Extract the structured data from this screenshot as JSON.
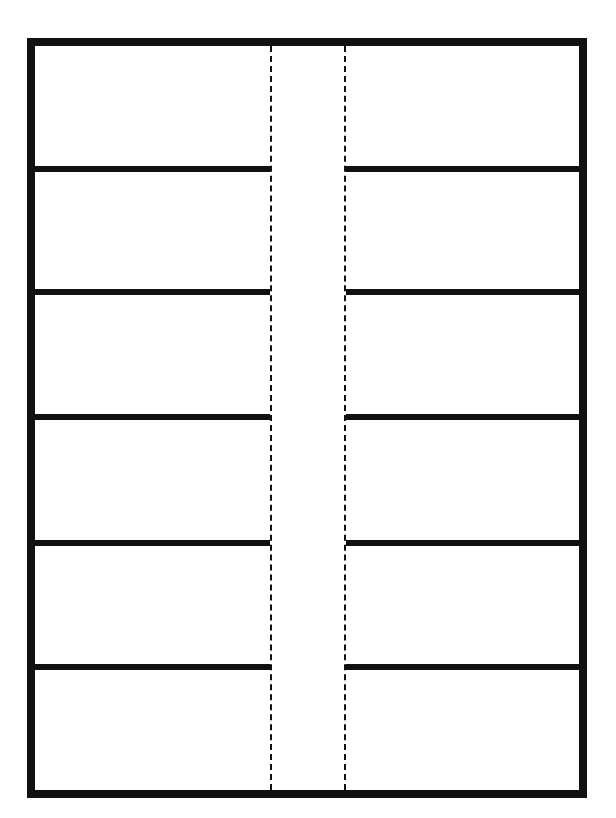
{
  "diagram": {
    "type": "fold-template",
    "frame": {
      "stroke_color": "#111111",
      "stroke_width": 8
    },
    "fold_lines": [
      {
        "name": "left-fold",
        "x": 270,
        "style": "dashed"
      },
      {
        "name": "right-fold",
        "x": 344,
        "style": "dashed"
      }
    ],
    "rows": 6,
    "divider_y": [
      166,
      289,
      414,
      540,
      664
    ],
    "panels": {
      "left": [
        "",
        "",
        "",
        "",
        "",
        ""
      ],
      "right": [
        "",
        "",
        "",
        "",
        "",
        ""
      ]
    },
    "colors": {
      "line": "#111111",
      "background": "#ffffff"
    }
  }
}
